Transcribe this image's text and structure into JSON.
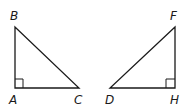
{
  "diagram": {
    "stroke_color": "#1a1a1a",
    "triangles": [
      {
        "name": "ABC",
        "right_angle_at": "A",
        "vertices": {
          "A": {
            "label": "A",
            "x": 15,
            "y": 88
          },
          "B": {
            "label": "B",
            "x": 15,
            "y": 27
          },
          "C": {
            "label": "C",
            "x": 79,
            "y": 88
          }
        }
      },
      {
        "name": "DFH",
        "right_angle_at": "H",
        "vertices": {
          "D": {
            "label": "D",
            "x": 110,
            "y": 88
          },
          "F": {
            "label": "F",
            "x": 175,
            "y": 27
          },
          "H": {
            "label": "H",
            "x": 175,
            "y": 88
          }
        }
      }
    ]
  }
}
